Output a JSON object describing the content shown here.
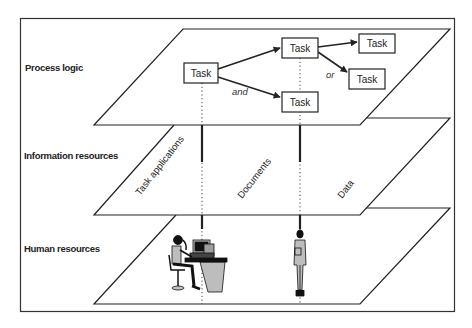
{
  "diagram": {
    "layers": [
      {
        "id": "process",
        "label": "Process logic"
      },
      {
        "id": "information",
        "label": "Information resources"
      },
      {
        "id": "human",
        "label": "Human resources"
      }
    ],
    "tasks": [
      {
        "id": "t1",
        "label": "Task"
      },
      {
        "id": "t2",
        "label": "Task"
      },
      {
        "id": "t3",
        "label": "Task"
      },
      {
        "id": "t4",
        "label": "Task"
      },
      {
        "id": "t5",
        "label": "Task"
      }
    ],
    "connectors": {
      "and": "and",
      "or": "or"
    },
    "information_items": [
      {
        "label": "Task applications"
      },
      {
        "label": "Documents"
      },
      {
        "label": "Data"
      }
    ],
    "human_items": [
      {
        "label": "person-at-computer"
      },
      {
        "label": "standing-person"
      }
    ],
    "colors": {
      "line": "#222222",
      "figure_fill": "#bdbdbd",
      "background": "#ffffff"
    }
  }
}
